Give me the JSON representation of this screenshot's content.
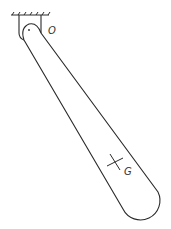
{
  "diagram": {
    "labels": {
      "pivot": "O",
      "center_of_mass": "G"
    },
    "colors": {
      "stroke": "#2a2a2a",
      "background": "#ffffff"
    },
    "elements": [
      {
        "name": "ceiling-support",
        "type": "hatched-line"
      },
      {
        "name": "pivot-bracket",
        "type": "bracket"
      },
      {
        "name": "pivot-pin",
        "type": "point",
        "label": "O"
      },
      {
        "name": "rod-body",
        "type": "tapered-link"
      },
      {
        "name": "center-of-mass-marker",
        "type": "cross",
        "label": "G"
      }
    ]
  }
}
